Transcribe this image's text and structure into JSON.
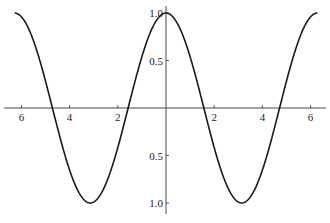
{
  "chart_data": {
    "type": "line",
    "title": "",
    "xlabel": "",
    "ylabel": "",
    "function": "y = cos(x)",
    "xlim": [
      -6.6,
      6.6
    ],
    "ylim": [
      -1.0,
      1.0
    ],
    "grid": false,
    "legend": null,
    "x_ticks": [
      -6,
      -4,
      -2,
      2,
      4,
      6
    ],
    "x_tick_labels": [
      "6",
      "4",
      "2",
      "2",
      "4",
      "6"
    ],
    "y_ticks": [
      1.0,
      0.5,
      -0.5,
      -1.0
    ],
    "y_tick_labels": [
      "1.0",
      "0.5",
      "0.5",
      "1.0"
    ],
    "series": [
      {
        "name": "cos(x)",
        "x": [
          -6.283,
          -4.712,
          -3.1416,
          -1.5708,
          0,
          1.5708,
          3.1416,
          4.712,
          6.283
        ],
        "values": [
          1,
          0,
          -1,
          0,
          1,
          0,
          -1,
          0,
          1
        ]
      }
    ],
    "colors": {
      "curve": "#1a1a1a",
      "axes": "#333333",
      "background": "#ffffff"
    }
  }
}
